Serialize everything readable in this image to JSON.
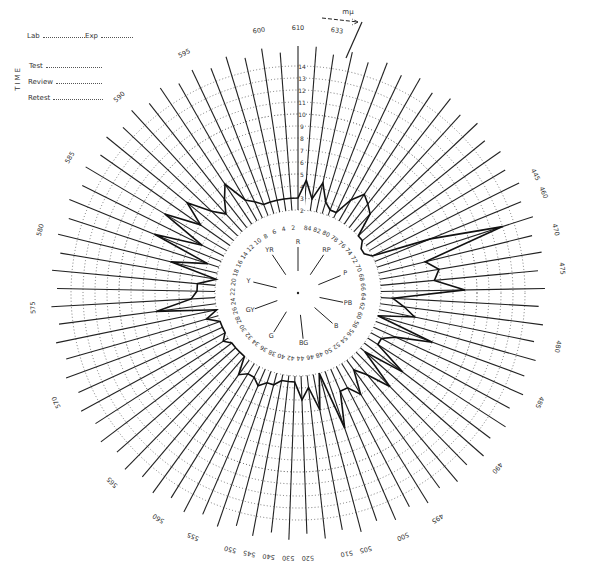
{
  "header": {
    "lab_label": "Lab",
    "exp_label": "Exp",
    "time_label": "TIME",
    "test_label": "Test",
    "review_label": "Review",
    "retest_label": "Retest"
  },
  "chart_data": {
    "type": "polar-line",
    "unit_label": "mμ",
    "center": [
      298,
      293
    ],
    "ring_values": [
      1,
      2,
      3,
      4,
      5,
      6,
      7,
      8,
      9,
      10,
      11,
      12,
      13,
      14
    ],
    "ring_labels_shown": [
      2,
      3,
      4,
      5,
      6,
      7,
      8,
      9,
      10,
      11,
      12,
      13,
      14
    ],
    "ring_radius_px": {
      "value_1": 71,
      "per_unit": 12
    },
    "cap_count": 85,
    "cap_number_labels": [
      2,
      4,
      6,
      8,
      10,
      12,
      14,
      16,
      18,
      20,
      22,
      24,
      26,
      28,
      30,
      32,
      34,
      36,
      38,
      40,
      42,
      44,
      46,
      48,
      50,
      52,
      54,
      56,
      58,
      60,
      62,
      64,
      66,
      68,
      70,
      72,
      74,
      76,
      78,
      80,
      82,
      84
    ],
    "hue_markers": [
      {
        "label": "R",
        "cap": 1
      },
      {
        "label": "YR",
        "cap": 9
      },
      {
        "label": "Y",
        "cap": 19
      },
      {
        "label": "GY",
        "cap": 27
      },
      {
        "label": "G",
        "cap": 36
      },
      {
        "label": "BG",
        "cap": 45
      },
      {
        "label": "B",
        "cap": 55
      },
      {
        "label": "PB",
        "cap": 62
      },
      {
        "label": "P",
        "cap": 70
      },
      {
        "label": "RP",
        "cap": 78
      }
    ],
    "wavelength_labels": [
      {
        "label": "610",
        "cap": 1
      },
      {
        "label": "633",
        "cap": 84
      },
      {
        "label": "600",
        "cap": 3
      },
      {
        "label": "595",
        "cap": 7
      },
      {
        "label": "590",
        "cap": 11
      },
      {
        "label": "585",
        "cap": 15
      },
      {
        "label": "580",
        "cap": 19
      },
      {
        "label": "575",
        "cap": 23
      },
      {
        "label": "570",
        "cap": 28
      },
      {
        "label": "565",
        "cap": 33
      },
      {
        "label": "560",
        "cap": 36
      },
      {
        "label": "555",
        "cap": 38
      },
      {
        "label": "550",
        "cap": 40
      },
      {
        "label": "545",
        "cap": 41
      },
      {
        "label": "540",
        "cap": 42
      },
      {
        "label": "530",
        "cap": 43
      },
      {
        "label": "520",
        "cap": 44
      },
      {
        "label": "510",
        "cap": 46
      },
      {
        "label": "505",
        "cap": 47
      },
      {
        "label": "500",
        "cap": 49
      },
      {
        "label": "495",
        "cap": 51
      },
      {
        "label": "490",
        "cap": 55
      },
      {
        "label": "485",
        "cap": 59
      },
      {
        "label": "480",
        "cap": 62
      },
      {
        "label": "475",
        "cap": 66
      },
      {
        "label": "470",
        "cap": 68
      },
      {
        "label": "460",
        "cap": 70
      },
      {
        "label": "445",
        "cap": 71
      }
    ],
    "scores": [
      3,
      3,
      3,
      3,
      3,
      3,
      3.5,
      4,
      6,
      5,
      4,
      5,
      7,
      5,
      8,
      4,
      8,
      3,
      6,
      2,
      3.5,
      3.5,
      4,
      7,
      2,
      3,
      2,
      2,
      2,
      2.5,
      2,
      2,
      2,
      2,
      3.5,
      3,
      3,
      3.5,
      3,
      3,
      2.5,
      2.5,
      2.5,
      4,
      3,
      5,
      2,
      7,
      4,
      4,
      5,
      3,
      4,
      6,
      2.5,
      6,
      3,
      3,
      4,
      7,
      2,
      5,
      4,
      3,
      9,
      6.5,
      7,
      6,
      13,
      7,
      2,
      1.5,
      1.5,
      2,
      2,
      4,
      4.5,
      5,
      4,
      2.5,
      2.5,
      3,
      4.5,
      3,
      4.5
    ]
  }
}
